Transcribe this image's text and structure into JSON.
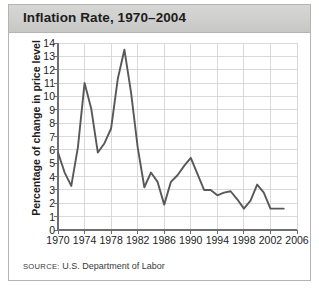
{
  "title": "Inflation Rate, 1970–2004",
  "source": {
    "label": "SOURCE:",
    "text": "U.S. Department of Labor"
  },
  "colors": {
    "titlebar": "#cfcfcd",
    "line": "#58585a",
    "grid": "#d9d9d9",
    "axis": "#6e6e70",
    "border": "#b4b4b4",
    "text": "#1d1d1d"
  },
  "chart_data": {
    "type": "line",
    "title": "Inflation Rate, 1970–2004",
    "xlabel": "",
    "ylabel": "Percentage of change in price level",
    "xlim": [
      1970,
      2006
    ],
    "ylim": [
      0,
      14
    ],
    "xticks": [
      1970,
      1974,
      1978,
      1982,
      1986,
      1990,
      1994,
      1998,
      2002,
      2006
    ],
    "yticks": [
      0,
      1,
      2,
      3,
      4,
      5,
      6,
      7,
      8,
      9,
      10,
      11,
      12,
      13,
      14
    ],
    "grid": true,
    "legend": false,
    "series": [
      {
        "name": "Inflation rate",
        "x": [
          1970,
          1971,
          1972,
          1973,
          1974,
          1975,
          1976,
          1977,
          1978,
          1979,
          1980,
          1981,
          1982,
          1983,
          1984,
          1985,
          1986,
          1987,
          1988,
          1989,
          1990,
          1991,
          1992,
          1993,
          1994,
          1995,
          1996,
          1997,
          1998,
          1999,
          2000,
          2001,
          2002,
          2003,
          2004
        ],
        "values": [
          5.8,
          4.3,
          3.3,
          6.2,
          11.0,
          9.1,
          5.8,
          6.5,
          7.6,
          11.3,
          13.5,
          10.3,
          6.2,
          3.2,
          4.3,
          3.6,
          1.9,
          3.6,
          4.1,
          4.8,
          5.4,
          4.2,
          3.0,
          3.0,
          2.6,
          2.8,
          2.9,
          2.3,
          1.6,
          2.2,
          3.4,
          2.8,
          1.6,
          1.6,
          1.6
        ]
      }
    ]
  }
}
